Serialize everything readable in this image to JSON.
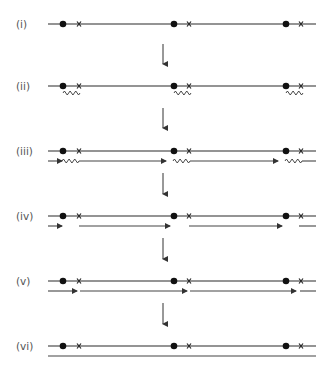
{
  "figure": {
    "colors": {
      "ink": "#2a2a2a",
      "label": "#555555",
      "background": "#ffffff"
    },
    "origin_marker": "filled-dot",
    "terminus_marker": "cross",
    "origins_count": 3,
    "steps": [
      {
        "label": "(i)",
        "strands": [
          "parental"
        ],
        "features": [
          "origins",
          "crosses"
        ]
      },
      {
        "label": "(ii)",
        "strands": [
          "parental"
        ],
        "features": [
          "origins",
          "crosses",
          "primers-below"
        ]
      },
      {
        "label": "(iii)",
        "strands": [
          "parental",
          "primed-extension"
        ],
        "features": [
          "origins",
          "crosses",
          "primers",
          "extension-arrows"
        ]
      },
      {
        "label": "(iv)",
        "strands": [
          "parental",
          "fragments-primers-removed"
        ],
        "features": [
          "origins",
          "crosses",
          "gapped-fragments"
        ]
      },
      {
        "label": "(v)",
        "strands": [
          "parental",
          "gap-filled-fragments"
        ],
        "features": [
          "origins",
          "crosses",
          "nicked-fragments"
        ]
      },
      {
        "label": "(vi)",
        "strands": [
          "parental",
          "ligated-complete"
        ],
        "features": [
          "origins",
          "crosses",
          "continuous-strand"
        ]
      }
    ],
    "step_arrow": "down-arrow"
  }
}
